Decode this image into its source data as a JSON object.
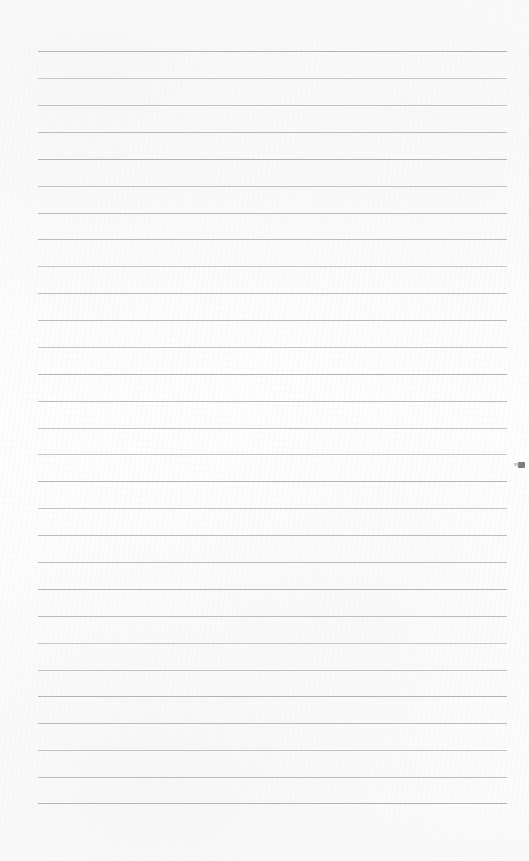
{
  "page": {
    "kind": "lined-notebook-page-scan",
    "width": 529,
    "height": 861,
    "paper_color": "#fdfdfc",
    "has_text_content": false,
    "text_content": "",
    "grain_visible": true
  },
  "rules": {
    "line_color": "#b4b6b9",
    "line_thickness_px": 1,
    "line_count": 29,
    "first_line_y": 51,
    "line_spacing_px": 26.9,
    "left_margin_x": 38,
    "right_end_x": 507,
    "line_length_px": 469,
    "y_positions": [
      51,
      78,
      105,
      132,
      159,
      186,
      213,
      239,
      266,
      293,
      320,
      347,
      374,
      401,
      428,
      454,
      481,
      508,
      535,
      562,
      589,
      616,
      643,
      670,
      696,
      723,
      750,
      777,
      803
    ]
  },
  "artifacts": {
    "edge_speck": {
      "name": "right-edge-speck",
      "x": 518,
      "y": 462,
      "color": "#6d6f73"
    }
  },
  "margins": {
    "top_blank_px": 51,
    "bottom_blank_px": 58,
    "left_blank_px": 38,
    "right_blank_px": 22
  }
}
